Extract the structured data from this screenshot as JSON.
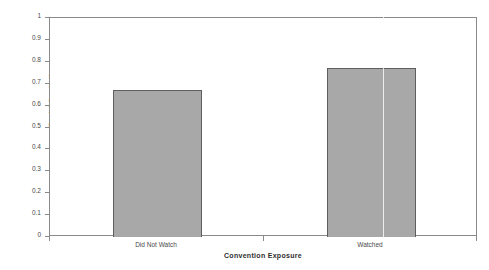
{
  "figure": {
    "cut_off_title": "",
    "background": "#ffffff"
  },
  "chart_data": {
    "type": "bar",
    "title": "",
    "categories": [
      "Did Not Watch",
      "Watched"
    ],
    "values": [
      0.67,
      0.77
    ],
    "xlabel": "Convention Exposure",
    "ylabel": "Racial Symbolism",
    "ylim": [
      0,
      1
    ],
    "ytick_labels": [
      "1",
      "0.9",
      "0.8",
      "0.7",
      "0.6",
      "0.5",
      "0.4",
      "0.3",
      "0.2",
      "0.1",
      "0"
    ],
    "ytick_values": [
      1,
      0.9,
      0.8,
      0.7,
      0.6,
      0.5,
      0.4,
      0.3,
      0.2,
      0.1,
      0
    ],
    "grid": false,
    "legend": false,
    "bar_color": "#a8a8a8",
    "bar_border_color": "#5e5e5e",
    "axis_color": "#8a8a8a"
  }
}
